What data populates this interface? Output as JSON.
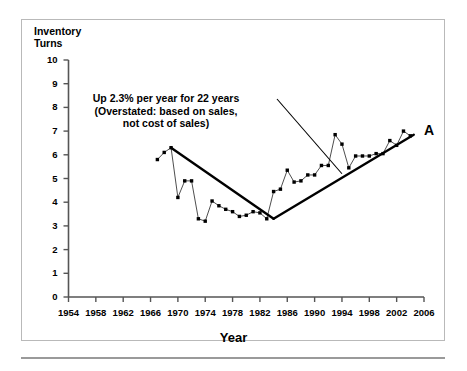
{
  "figure": {
    "frame_color": "#b9b9b9",
    "rule_color": "#9a9a9a",
    "background": "#ffffff"
  },
  "chart_data": {
    "type": "line",
    "title": "",
    "xlabel": "Year",
    "ylabel": "Inventory Turns",
    "ylabel_lines": [
      "Inventory",
      "Turns"
    ],
    "xlim": [
      1954,
      2006
    ],
    "ylim": [
      0,
      10
    ],
    "yticks": [
      0,
      1,
      2,
      3,
      4,
      5,
      6,
      7,
      8,
      9,
      10
    ],
    "ytick_labels": [
      "0",
      "1",
      "2",
      "3",
      "4",
      "5",
      "6",
      "7",
      "8",
      "9",
      "10"
    ],
    "xticks": [
      1954,
      1958,
      1962,
      1966,
      1970,
      1974,
      1978,
      1982,
      1986,
      1990,
      1994,
      1998,
      2002,
      2006
    ],
    "xtick_labels": [
      "1954",
      "1958",
      "1962",
      "1966",
      "1970",
      "1974",
      "1978",
      "1982",
      "1986",
      "1990",
      "1994",
      "1998",
      "2002",
      "2006"
    ],
    "grid": false,
    "legend": "none",
    "series": [
      {
        "name": "A",
        "label": "A",
        "marker": "square",
        "color": "#000000",
        "x": [
          1967,
          1968,
          1969,
          1970,
          1971,
          1972,
          1973,
          1974,
          1975,
          1976,
          1977,
          1978,
          1979,
          1980,
          1981,
          1982,
          1983,
          1984,
          1985,
          1986,
          1987,
          1988,
          1989,
          1990,
          1991,
          1992,
          1993,
          1994,
          1995,
          1996,
          1997,
          1998,
          1999,
          2000,
          2001,
          2002,
          2003,
          2004
        ],
        "values": [
          5.8,
          6.1,
          6.3,
          4.2,
          4.9,
          4.9,
          3.3,
          3.2,
          4.05,
          3.85,
          3.7,
          3.6,
          3.4,
          3.45,
          3.6,
          3.55,
          3.3,
          4.45,
          4.55,
          5.35,
          4.85,
          4.9,
          5.15,
          5.15,
          5.55,
          5.55,
          6.85,
          6.45,
          5.45,
          5.95,
          5.95,
          5.95,
          6.05,
          6.05,
          6.6,
          6.4,
          7.0,
          6.8
        ]
      }
    ],
    "annotations": [
      {
        "name": "growth-callout",
        "text": "Up 2.3% per year for 22 years\n(Overstated: based on sales,\nnot cost of sales)",
        "lines": [
          "Up 2.3% per year for 22 years",
          "(Overstated: based on sales,",
          "not cost of sales)"
        ]
      },
      {
        "name": "declining-trend-line",
        "type": "trend-line",
        "from": [
          1969,
          6.3
        ],
        "to": [
          1984,
          3.3
        ]
      },
      {
        "name": "rising-trend-line",
        "type": "trend-line",
        "from": [
          1984,
          3.3
        ],
        "to": [
          2004.5,
          6.85
        ],
        "note": "Up 2.3% per year for 22 years"
      },
      {
        "name": "callout-leader-line",
        "type": "leader-line",
        "from_text_anchor": true,
        "to": [
          1994,
          5.2
        ]
      },
      {
        "name": "series-label",
        "text": "A"
      }
    ]
  }
}
